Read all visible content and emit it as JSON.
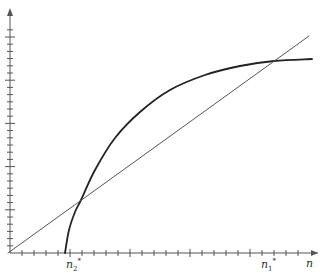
{
  "chart_data": {
    "type": "line",
    "title": "",
    "xlabel": "n",
    "ylabel": "",
    "grid": false,
    "legend": null,
    "axes": {
      "x_ticks_minor_count": 24,
      "x_major_every": 5,
      "y_ticks_minor_count": 31,
      "y_major_every": 6
    },
    "series": [
      {
        "name": "curve",
        "style": "thick",
        "points_px": [
          [
            65,
            253
          ],
          [
            69,
            230
          ],
          [
            75,
            212
          ],
          [
            81,
            200
          ],
          [
            95,
            170
          ],
          [
            115,
            138
          ],
          [
            140,
            112
          ],
          [
            170,
            90
          ],
          [
            205,
            75
          ],
          [
            240,
            66
          ],
          [
            274,
            61
          ],
          [
            312,
            59
          ]
        ]
      },
      {
        "name": "45-degree line",
        "style": "thin",
        "points_px": [
          [
            8,
            253
          ],
          [
            309,
            36
          ]
        ]
      }
    ],
    "annotations": [
      {
        "text": "n",
        "sub": "2",
        "sup": "*",
        "x_px": 72,
        "note": "lower intersection"
      },
      {
        "text": "n",
        "sub": "1",
        "sup": "*",
        "x_px": 268,
        "note": "upper intersection"
      },
      {
        "text": "n",
        "x_px": 308,
        "note": "x-axis label"
      }
    ]
  },
  "labels": {
    "n2_base": "n",
    "n2_sub": "2",
    "n2_sup": "*",
    "n1_base": "n",
    "n1_sub": "1",
    "n1_sup": "*",
    "x_axis": "n"
  },
  "colors": {
    "axis": "#555555",
    "curve": "#222222",
    "line": "#555555"
  }
}
